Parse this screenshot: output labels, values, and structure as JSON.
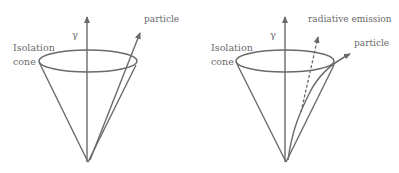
{
  "diagrams": [
    {
      "name": "isolated-particle",
      "axis_label": "γ",
      "cone_label_line1": "Isolation",
      "cone_label_line2": "cone",
      "particle_label": "particle"
    },
    {
      "name": "particle-with-radiative-emission",
      "axis_label": "γ",
      "cone_label_line1": "Isolation",
      "cone_label_line2": "cone",
      "particle_label": "particle",
      "emission_label": "radiative emission"
    }
  ],
  "colors": {
    "stroke": "#6a6a6a",
    "text": "#6a6a6a",
    "background": "#ffffff"
  }
}
